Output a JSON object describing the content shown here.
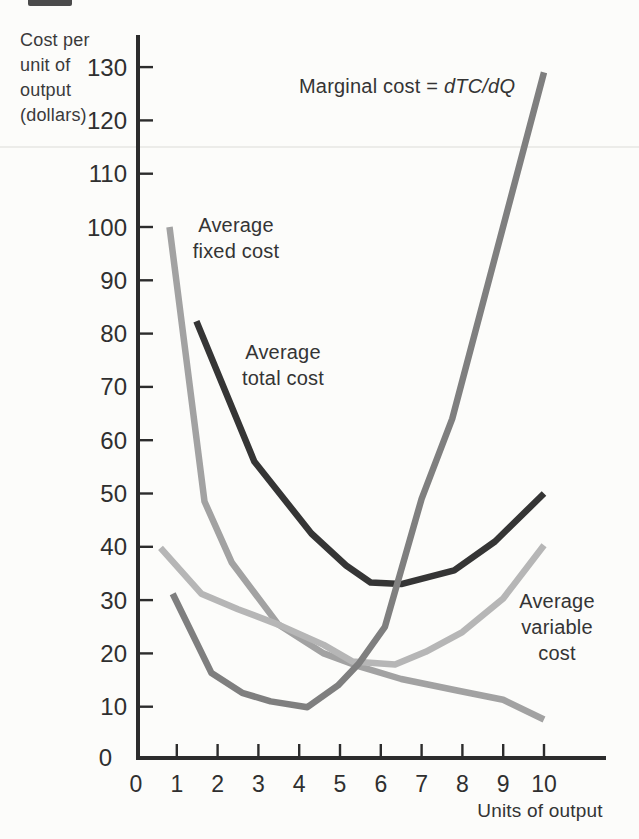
{
  "figure": {
    "kind": "scanned textbook cost-curve figure",
    "background": "#fcfcfa"
  },
  "labels": {
    "y_axis": "Cost per\nunit of\noutput\n(dollars)",
    "x_axis": "Units of output",
    "afc": "Average\nfixed cost",
    "atc": "Average\ntotal cost",
    "avc": "Average\nvariable\ncost",
    "mc_prefix": "Marginal cost = ",
    "mc_formula": "dTC/dQ"
  },
  "chart_data": {
    "type": "line",
    "title": "",
    "xlabel": "Units of output",
    "ylabel": "Cost per unit of output (dollars)",
    "xlim": [
      0,
      11.5
    ],
    "ylim": [
      0,
      136
    ],
    "grid": false,
    "legend_position": "inline-annotations",
    "axis_color": "#2c2c2c",
    "text_color": "#2f2f2f",
    "x_ticks": [
      0,
      1,
      2,
      3,
      4,
      5,
      6,
      7,
      8,
      9,
      10
    ],
    "y_ticks": [
      0,
      10,
      20,
      30,
      40,
      50,
      60,
      70,
      80,
      90,
      100,
      110,
      120,
      130
    ],
    "series": [
      {
        "id": "afc",
        "name": "Average fixed cost",
        "color": "#a2a2a2",
        "points": [
          [
            0.82,
            100
          ],
          [
            1.68,
            48.5
          ],
          [
            2.35,
            37
          ],
          [
            3.49,
            25.4
          ],
          [
            4.6,
            20
          ],
          [
            5.45,
            17.6
          ],
          [
            6.5,
            15.2
          ],
          [
            7.9,
            13
          ],
          [
            9,
            11.3
          ],
          [
            10,
            7.6
          ]
        ]
      },
      {
        "id": "avc",
        "name": "Average variable cost",
        "color": "#b6b6b6",
        "points": [
          [
            0.6,
            39.8
          ],
          [
            1.6,
            31.2
          ],
          [
            2.5,
            28.3
          ],
          [
            3.49,
            25.4
          ],
          [
            4.6,
            21.6
          ],
          [
            5.3,
            18.5
          ],
          [
            6.35,
            17.9
          ],
          [
            7.1,
            20.3
          ],
          [
            8,
            24
          ],
          [
            9,
            30.3
          ],
          [
            10,
            40.3
          ]
        ]
      },
      {
        "id": "atc",
        "name": "Average total cost",
        "color": "#353535",
        "points": [
          [
            1.48,
            82.3
          ],
          [
            2.9,
            56
          ],
          [
            4.3,
            42.5
          ],
          [
            5.15,
            36.5
          ],
          [
            5.75,
            33.3
          ],
          [
            6.5,
            33
          ],
          [
            7.8,
            35.6
          ],
          [
            8.8,
            41
          ],
          [
            10,
            50
          ]
        ]
      },
      {
        "id": "mc",
        "name": "Marginal cost",
        "color": "#7f7f7f",
        "points": [
          [
            0.9,
            31.2
          ],
          [
            1.85,
            16.3
          ],
          [
            2.6,
            12.6
          ],
          [
            3.3,
            11
          ],
          [
            4.2,
            9.9
          ],
          [
            4.95,
            14
          ],
          [
            5.45,
            18
          ],
          [
            6.1,
            25
          ],
          [
            7,
            49
          ],
          [
            7.75,
            64
          ],
          [
            10,
            129
          ]
        ]
      }
    ]
  }
}
